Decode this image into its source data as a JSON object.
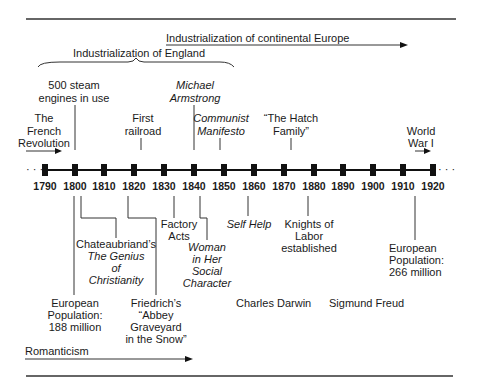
{
  "timeline": {
    "years": [
      "1790",
      "1800",
      "1810",
      "1820",
      "1830",
      "1840",
      "1850",
      "1860",
      "1870",
      "1880",
      "1890",
      "1900",
      "1910",
      "1920"
    ],
    "ellipsis_left": "· · ·",
    "ellipsis_right": "· · ·"
  },
  "periods": {
    "continental": "Industrialization of continental Europe",
    "england": "Industrialization of England",
    "romanticism": "Romanticism",
    "french_revolution": [
      "The",
      "French",
      "Revolution"
    ],
    "world_war": [
      "World",
      "War I"
    ]
  },
  "above": {
    "steam": [
      "500 steam",
      "engines in use"
    ],
    "railroad": [
      "First",
      "railroad"
    ],
    "armstrong": [
      "Michael",
      "Armstrong"
    ],
    "manifesto": [
      "Communist",
      "Manifesto"
    ],
    "hatch": [
      "“The Hatch",
      "Family”"
    ]
  },
  "below": {
    "chateaubriand": [
      "Chateaubriand’s",
      "The Genius",
      "of",
      "Christianity"
    ],
    "pop1800": [
      "European",
      "Population:",
      "188 million"
    ],
    "friedrich": [
      "Friedrich’s",
      "“Abbey",
      "Graveyard",
      "in the Snow”"
    ],
    "factory": [
      "Factory",
      "Acts"
    ],
    "woman": [
      "Woman",
      "in Her",
      "Social",
      "Character"
    ],
    "selfhelp": "Self Help",
    "knights": [
      "Knights of",
      "Labor",
      "established"
    ],
    "pop1910": [
      "European",
      "Population:",
      "266 million"
    ],
    "darwin": "Charles Darwin",
    "freud": "Sigmund Freud"
  }
}
